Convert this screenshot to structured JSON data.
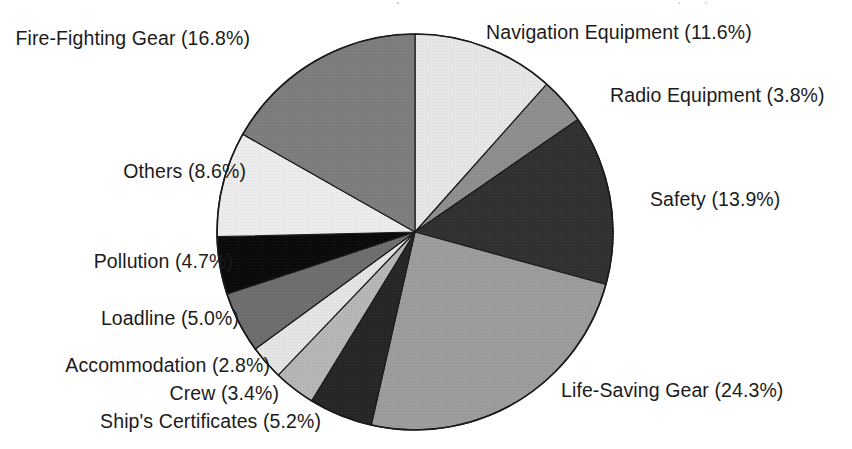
{
  "chart_data": {
    "type": "pie",
    "title": "",
    "subtitle": "",
    "xlabel": "",
    "ylabel": "",
    "legend_position": "none",
    "grid": false,
    "units": "percent",
    "start_angle_deg": 0,
    "direction": "clockwise",
    "total_percent": 100.1,
    "categories": [
      "Navigation Equipment",
      "Radio Equipment",
      "Safety",
      "Life-Saving Gear",
      "Ship's Certificates",
      "Crew",
      "Accommodation",
      "Loadline",
      "Pollution",
      "Others",
      "Fire-Fighting Gear"
    ],
    "values": [
      11.6,
      3.8,
      13.9,
      24.3,
      5.2,
      3.4,
      2.8,
      5.0,
      4.7,
      8.6,
      16.8
    ],
    "slice_fills": [
      "#e6e6e6",
      "#8e8e8e",
      "#303030",
      "#9c9c9c",
      "#262626",
      "#b6b6b6",
      "#e4e4e4",
      "#6e6e6e",
      "#0a0a0a",
      "#ececec",
      "#7d7d7d"
    ],
    "slices": [
      {
        "label": "Navigation Equipment",
        "value": 11.6,
        "text": "Navigation Equipment (11.6%)",
        "fill": "#e6e6e6"
      },
      {
        "label": "Radio Equipment",
        "value": 3.8,
        "text": "Radio Equipment (3.8%)",
        "fill": "#8e8e8e"
      },
      {
        "label": "Safety",
        "value": 13.9,
        "text": "Safety (13.9%)",
        "fill": "#303030"
      },
      {
        "label": "Life-Saving Gear",
        "value": 24.3,
        "text": "Life-Saving Gear (24.3%)",
        "fill": "#9c9c9c"
      },
      {
        "label": "Ship's Certificates",
        "value": 5.2,
        "text": "Ship's Certificates (5.2%)",
        "fill": "#262626"
      },
      {
        "label": "Crew",
        "value": 3.4,
        "text": "Crew (3.4%)",
        "fill": "#b6b6b6"
      },
      {
        "label": "Accommodation",
        "value": 2.8,
        "text": "Accommodation (2.8%)",
        "fill": "#e4e4e4"
      },
      {
        "label": "Loadline",
        "value": 5.0,
        "text": "Loadline (5.0%)",
        "fill": "#6e6e6e"
      },
      {
        "label": "Pollution",
        "value": 4.7,
        "text": "Pollution (4.7%)",
        "fill": "#0a0a0a"
      },
      {
        "label": "Others",
        "value": 8.6,
        "text": "Others (8.6%)",
        "fill": "#ececec"
      },
      {
        "label": "Fire-Fighting Gear",
        "value": 16.8,
        "text": "Fire-Fighting Gear (16.8%)",
        "fill": "#7d7d7d"
      }
    ],
    "geometry": {
      "center_x": 415,
      "center_y": 232,
      "radius": 198,
      "outline_color": "#1a1a1a"
    }
  },
  "labels": {
    "navigation_equipment": "Navigation Equipment (11.6%)",
    "radio_equipment": "Radio Equipment (3.8%)",
    "safety": "Safety (13.9%)",
    "life_saving_gear": "Life-Saving Gear (24.3%)",
    "ships_certificates": "Ship's Certificates (5.2%)",
    "crew": "Crew (3.4%)",
    "accommodation": "Accommodation (2.8%)",
    "loadline": "Loadline (5.0%)",
    "pollution": "Pollution (4.7%)",
    "others": "Others (8.6%)",
    "fire_fighting_gear": "Fire-Fighting Gear (16.8%)"
  }
}
